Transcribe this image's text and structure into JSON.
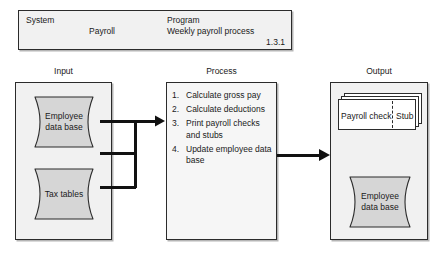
{
  "header": {
    "system_label": "System",
    "system_value": "Payroll",
    "program_label": "Program",
    "program_value": "Weekly payroll process",
    "version": "1.3.1"
  },
  "columns": {
    "input_caption": "Input",
    "process_caption": "Process",
    "output_caption": "Output"
  },
  "input": {
    "stores": [
      {
        "label_line1": "Employee",
        "label_line2": "data base"
      },
      {
        "label_line1": "Tax tables",
        "label_line2": ""
      }
    ]
  },
  "process": {
    "steps": [
      {
        "number": "1.",
        "text": "Calculate gross pay"
      },
      {
        "number": "2.",
        "text": "Calculate deductions"
      },
      {
        "number": "3.",
        "text": "Print payroll checks and stubs"
      },
      {
        "number": "4.",
        "text": "Update employee data base"
      }
    ]
  },
  "output": {
    "document": {
      "left_label": "Payroll check",
      "right_label": "Stub"
    },
    "store": {
      "label_line1": "Employee",
      "label_line2": "data base"
    }
  },
  "colors": {
    "panel_fill": "#f1f1f1",
    "shape_fill": "#d6d6d6",
    "stroke": "#2b2b2b",
    "paper": "#ffffff"
  }
}
